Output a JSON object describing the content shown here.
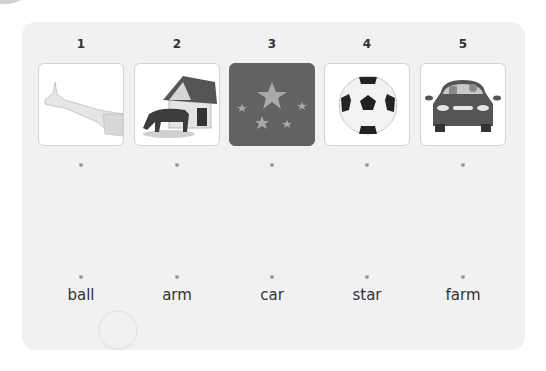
{
  "exercise": {
    "items": [
      {
        "number": "1",
        "image": "arm-image",
        "image_desc": "outstretched arm"
      },
      {
        "number": "2",
        "image": "farm-image",
        "image_desc": "horse grazing by barn"
      },
      {
        "number": "3",
        "image": "stars-image",
        "image_desc": "stars on dark background"
      },
      {
        "number": "4",
        "image": "ball-image",
        "image_desc": "soccer ball"
      },
      {
        "number": "5",
        "image": "car-image",
        "image_desc": "car with passengers"
      }
    ],
    "words": [
      "ball",
      "arm",
      "car",
      "star",
      "farm"
    ]
  },
  "colors": {
    "panel_bg": "#f1f1f1",
    "card_border": "#d2d2d2",
    "star_card_bg": "#626262",
    "dot": "#9a9a9a",
    "text": "#333333"
  }
}
